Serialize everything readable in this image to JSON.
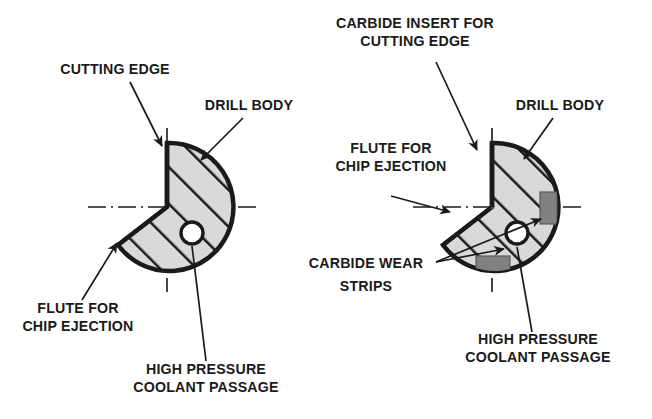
{
  "figure": {
    "type": "technical-cross-section-diagram",
    "background_color": "#ffffff",
    "line_color": "#1a1a1a",
    "hatch_fill_color": "#d9d9d9",
    "carbide_fill_color": "#808080",
    "hole_fill_color": "#ffffff"
  },
  "left_drill": {
    "name": "conventional-drill-cross-section",
    "center": {
      "x": 167,
      "y": 207
    },
    "radius": 64,
    "flute_description": "V shaped notch removed from the left side for chip ejection",
    "coolant_hole": {
      "x": 192,
      "y": 233,
      "r": 11
    },
    "hatch_angle_deg": 45,
    "labels": [
      {
        "id": "cutting-edge",
        "text_lines": [
          "CUTTING EDGE"
        ],
        "text_x": 115,
        "text_y": 74,
        "anchor": "middle",
        "leader_from": {
          "x": 130,
          "y": 82
        },
        "leader_to": {
          "x": 162,
          "y": 146
        }
      },
      {
        "id": "drill-body",
        "text_lines": [
          "DRILL BODY"
        ],
        "text_x": 249,
        "text_y": 110,
        "anchor": "middle",
        "leader_from": {
          "x": 243,
          "y": 118
        },
        "leader_to": {
          "x": 201,
          "y": 160
        }
      },
      {
        "id": "flute-for-chip-ejection",
        "text_lines": [
          "FLUTE FOR",
          "CHIP EJECTION"
        ],
        "text_x": 78,
        "text_y": 313,
        "anchor": "middle",
        "leader_from": {
          "x": 82,
          "y": 300
        },
        "leader_to": {
          "x": 117,
          "y": 243
        }
      },
      {
        "id": "high-pressure-coolant-passage",
        "text_lines": [
          "HIGH PRESSURE",
          "COOLANT PASSAGE"
        ],
        "text_x": 206,
        "text_y": 374,
        "anchor": "middle",
        "leader_from": {
          "x": 206,
          "y": 361
        },
        "leader_to": {
          "x": 192,
          "y": 246
        }
      }
    ]
  },
  "right_drill": {
    "name": "carbide-tipped-drill-cross-section",
    "center": {
      "x": 492,
      "y": 207
    },
    "radius": 64,
    "flute_description": "V shaped notch removed from the left side for chip ejection",
    "coolant_hole": {
      "x": 517,
      "y": 233,
      "r": 11
    },
    "hatch_angle_deg": 45,
    "carbide_parts": [
      {
        "id": "carbide-insert-cutting-edge",
        "x": 478,
        "y": 146,
        "w": 15,
        "h": 62
      },
      {
        "id": "carbide-wear-strip-right",
        "x": 542,
        "y": 192,
        "w": 14,
        "h": 30
      },
      {
        "id": "carbide-wear-strip-bottom",
        "x": 478,
        "y": 258,
        "w": 32,
        "h": 13
      }
    ],
    "labels": [
      {
        "id": "carbide-insert-for-cutting-edge",
        "text_lines": [
          "CARBIDE INSERT FOR",
          "CUTTING EDGE"
        ],
        "text_x": 415,
        "text_y": 28,
        "anchor": "middle",
        "leader_from": {
          "x": 436,
          "y": 62
        },
        "leader_to": {
          "x": 478,
          "y": 148
        }
      },
      {
        "id": "drill-body",
        "text_lines": [
          "DRILL BODY"
        ],
        "text_x": 560,
        "text_y": 110,
        "anchor": "middle",
        "leader_from": {
          "x": 553,
          "y": 118
        },
        "leader_to": {
          "x": 524,
          "y": 159
        }
      },
      {
        "id": "flute-for-chip-ejection",
        "text_lines": [
          "FLUTE FOR",
          "CHIP EJECTION"
        ],
        "text_x": 391,
        "text_y": 153,
        "anchor": "middle",
        "leader_from": {
          "x": 391,
          "y": 178
        },
        "leader_to": {
          "x": 447,
          "y": 210
        }
      },
      {
        "id": "carbide-wear-strips",
        "text_lines": [
          "CARBIDE WEAR",
          "STRIPS"
        ],
        "text_x": 366,
        "text_y": 268,
        "anchor": "middle",
        "leader_from": {
          "x": 436,
          "y": 262
        },
        "leader_to_1": {
          "x": 505,
          "y": 246
        },
        "leader_to_2": {
          "x": 543,
          "y": 216
        }
      },
      {
        "id": "high-pressure-coolant-passage",
        "text_lines": [
          "HIGH PRESSURE",
          "COOLANT PASSAGE"
        ],
        "text_x": 538,
        "text_y": 344,
        "anchor": "middle",
        "leader_from": {
          "x": 532,
          "y": 332
        },
        "leader_to": {
          "x": 517,
          "y": 247
        }
      }
    ]
  },
  "text": {
    "cutting_edge": "CUTTING EDGE",
    "drill_body": "DRILL BODY",
    "flute_for": "FLUTE FOR",
    "chip_ejection": "CHIP EJECTION",
    "high_pressure": "HIGH PRESSURE",
    "coolant_passage": "COOLANT PASSAGE",
    "carbide_insert_for": "CARBIDE INSERT FOR",
    "carbide_cutting_edge": "CUTTING EDGE",
    "drill_body_right": "DRILL BODY",
    "flute_for_right": "FLUTE FOR",
    "chip_ejection_right": "CHIP EJECTION",
    "carbide_wear": "CARBIDE WEAR",
    "strips": "STRIPS",
    "high_pressure_right": "HIGH PRESSURE",
    "coolant_passage_right": "COOLANT PASSAGE"
  }
}
